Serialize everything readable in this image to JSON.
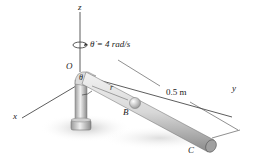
{
  "figure": {
    "axes": {
      "z": "z",
      "x": "x",
      "y": "y"
    },
    "points": {
      "origin": "O",
      "collar": "B",
      "end": "C"
    },
    "angle_label": "θ",
    "radial_label": "r",
    "angular_velocity": "θ̇ = 4 rad/s",
    "dimension": "0.5 m"
  },
  "colors": {
    "rod_light": "#e6e6e6",
    "rod_dark": "#8c8c8c",
    "shadow": "#d0d0d0",
    "line": "#333333"
  }
}
